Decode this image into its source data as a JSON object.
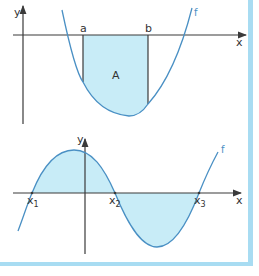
{
  "colors": {
    "curve": "#4a90c4",
    "area_fill": "#c8ecf7",
    "axis": "#3a3a3a",
    "frame": "#a8dcf2"
  },
  "top_panel": {
    "y_axis_label": "y",
    "x_axis_label": "x",
    "function_label": "f",
    "bound_a_label": "a",
    "bound_b_label": "b",
    "area_label": "A"
  },
  "bottom_panel": {
    "y_axis_label": "y",
    "x_axis_label": "x",
    "function_label": "f",
    "root1_label": "x",
    "root1_sub": "1",
    "root2_label": "x",
    "root2_sub": "2",
    "root3_label": "x",
    "root3_sub": "3"
  }
}
